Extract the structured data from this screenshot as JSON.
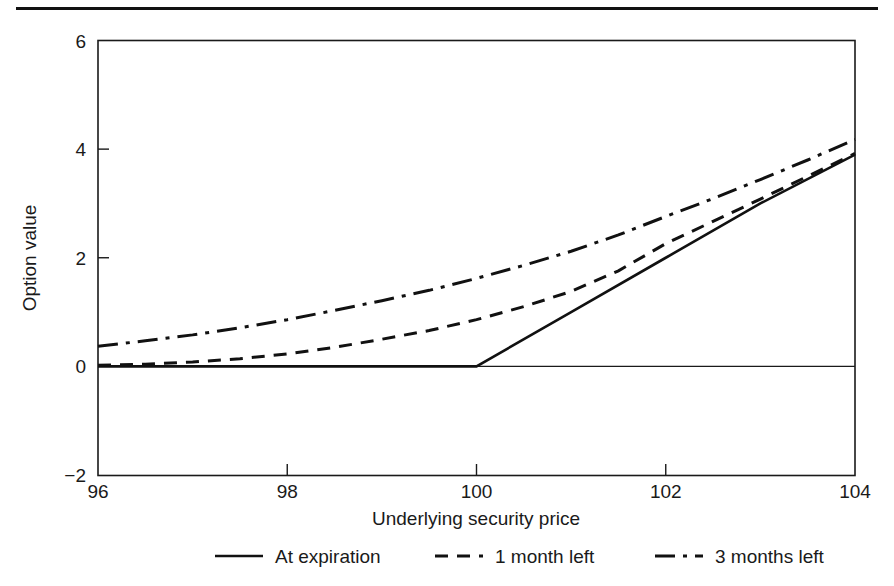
{
  "figure": {
    "divider_name": "top-rule"
  },
  "chart_data": {
    "type": "line",
    "title": "",
    "xlabel": "Underlying security price",
    "ylabel": "Option value",
    "xlim": [
      96,
      104
    ],
    "ylim": [
      -2,
      6
    ],
    "xticks": [
      96,
      98,
      100,
      102,
      104
    ],
    "yticks": [
      -2,
      0,
      2,
      4,
      6
    ],
    "xtick_labels": [
      "96",
      "98",
      "100",
      "102",
      "104"
    ],
    "ytick_labels": [
      "-2",
      "0",
      "2",
      "4",
      "6"
    ],
    "grid": false,
    "zero_line": 0,
    "strike": 100,
    "legend_position": "below",
    "series": [
      {
        "name": "At expiration",
        "style": "solid",
        "color": "#111111",
        "x": [
          96,
          97,
          98,
          99,
          100,
          101,
          102,
          103,
          104
        ],
        "values": [
          0,
          0,
          0,
          0,
          0,
          1,
          2,
          3,
          3.9
        ]
      },
      {
        "name": "1 month left",
        "style": "dashed",
        "color": "#111111",
        "x": [
          96,
          96.5,
          97,
          97.5,
          98,
          98.5,
          99,
          99.5,
          100,
          100.5,
          101,
          101.5,
          102,
          102.5,
          103,
          103.5,
          104
        ],
        "values": [
          0.02,
          0.04,
          0.08,
          0.14,
          0.23,
          0.35,
          0.5,
          0.66,
          0.86,
          1.1,
          1.38,
          1.76,
          2.26,
          2.67,
          3.08,
          3.5,
          3.92
        ]
      },
      {
        "name": "3 months left",
        "style": "dashdot",
        "color": "#111111",
        "x": [
          96,
          96.5,
          97,
          97.5,
          98,
          98.5,
          99,
          99.5,
          100,
          100.5,
          101,
          101.5,
          102,
          102.5,
          103,
          103.5,
          104
        ],
        "values": [
          0.37,
          0.47,
          0.58,
          0.71,
          0.86,
          1.03,
          1.21,
          1.4,
          1.62,
          1.86,
          2.12,
          2.42,
          2.76,
          3.09,
          3.44,
          3.8,
          4.18
        ]
      }
    ]
  },
  "legend": {
    "items": [
      {
        "label": "At expiration",
        "style": "solid"
      },
      {
        "label": "1 month left",
        "style": "dashed"
      },
      {
        "label": "3 months left",
        "style": "dashdot"
      }
    ]
  }
}
